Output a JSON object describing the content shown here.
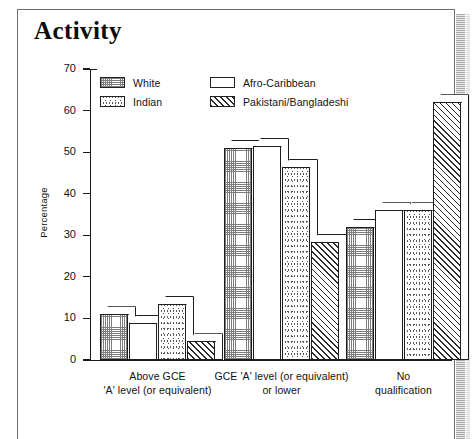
{
  "page": {
    "title": "Activity"
  },
  "chart_data": {
    "type": "bar",
    "title": "Activity",
    "xlabel": "",
    "ylabel": "Percentage",
    "ylim": [
      0,
      70
    ],
    "yticks": [
      0,
      10,
      20,
      30,
      40,
      50,
      60,
      70
    ],
    "grid": false,
    "legend_position": "top-left-inside",
    "categories": [
      "Above GCE 'A' level (or equivalent)",
      "GCE 'A' level (or equivalent) or lower",
      "No qualification"
    ],
    "category_lines": [
      [
        "Above GCE",
        "'A' level (or equivalent)"
      ],
      [
        "GCE 'A' level (or equivalent)",
        "or lower"
      ],
      [
        "No",
        "qualification"
      ]
    ],
    "series": [
      {
        "name": "White",
        "pattern": "fine-dot-grid",
        "values": [
          11,
          51,
          32
        ]
      },
      {
        "name": "Afro-Caribbean",
        "pattern": "blank",
        "values": [
          9,
          51.5,
          36
        ]
      },
      {
        "name": "Indian",
        "pattern": "speckle",
        "values": [
          13.5,
          46.5,
          36
        ]
      },
      {
        "name": "Pakistani/Bangladeshi",
        "pattern": "diagonal-hatch",
        "values": [
          4.5,
          28.5,
          62
        ]
      }
    ]
  },
  "legend": {
    "items": [
      {
        "label": "White",
        "pattern": "fine-dot-grid"
      },
      {
        "label": "Afro-Caribbean",
        "pattern": "blank"
      },
      {
        "label": "Indian",
        "pattern": "speckle"
      },
      {
        "label": "Pakistani/Bangladeshi",
        "pattern": "diagonal-hatch"
      }
    ]
  }
}
